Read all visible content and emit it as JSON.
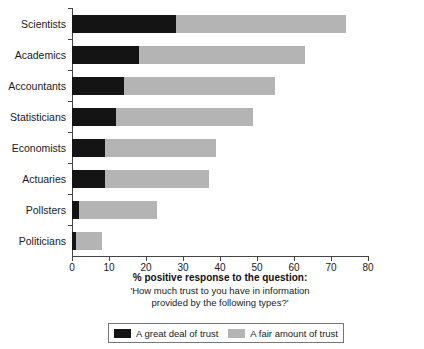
{
  "chart_data": {
    "type": "bar",
    "orientation": "horizontal",
    "stacked": true,
    "title": "",
    "xlabel": "% positive response to the question:",
    "ylabel": "",
    "xlim": [
      0,
      80
    ],
    "xticks": [
      0,
      10,
      20,
      30,
      40,
      50,
      60,
      70,
      80
    ],
    "grid": false,
    "legend_position": "bottom",
    "categories": [
      "Scientists",
      "Academics",
      "Accountants",
      "Statisticians",
      "Economists",
      "Actuaries",
      "Pollsters",
      "Politicians"
    ],
    "series": [
      {
        "name": "A great deal of trust",
        "color": "#141414",
        "values": [
          28,
          18,
          14,
          12,
          9,
          9,
          2,
          1
        ]
      },
      {
        "name": "A fair amount of trust",
        "color": "#b4b4b4",
        "values": [
          46,
          45,
          41,
          37,
          30,
          28,
          21,
          7
        ]
      }
    ],
    "totals": [
      74,
      63,
      55,
      49,
      39,
      37,
      23,
      8
    ],
    "annotations": {
      "caption_line1": "% positive response to the question:",
      "caption_line2": "'How much trust to you have in information",
      "caption_line3": "provided by the following types?'"
    }
  },
  "axis": {
    "tick_labels": [
      "0",
      "10",
      "20",
      "30",
      "40",
      "50",
      "60",
      "70",
      "80"
    ]
  },
  "caption": {
    "line1": "% positive response to the question:",
    "line2": "'How much trust to you have in information",
    "line3": "provided by the following types?'"
  },
  "legend": {
    "items": [
      {
        "label": "A great deal of trust",
        "color": "#141414"
      },
      {
        "label": "A fair amount of trust",
        "color": "#b4b4b4"
      }
    ]
  },
  "colors": {
    "great_deal": "#141414",
    "fair_amount": "#b4b4b4",
    "axis": "#444444",
    "background": "#ffffff"
  }
}
